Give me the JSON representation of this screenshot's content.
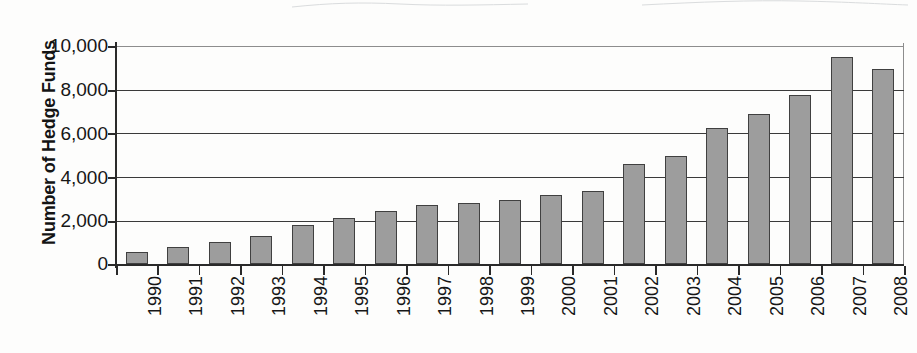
{
  "chart_data": {
    "type": "bar",
    "title": "",
    "subtitle": "",
    "xlabel": "",
    "ylabel": "Number of Hedge Funds",
    "categories": [
      "1990",
      "1991",
      "1992",
      "1993",
      "1994",
      "1995",
      "1996",
      "1997",
      "1998",
      "1999",
      "2000",
      "2001",
      "2002",
      "2003",
      "2004",
      "2005",
      "2006",
      "2007",
      "2008"
    ],
    "values": [
      560,
      780,
      1010,
      1300,
      1800,
      2100,
      2450,
      2700,
      2800,
      2950,
      3150,
      3350,
      4600,
      4950,
      6250,
      6900,
      7750,
      9500,
      8950
    ],
    "ylim": [
      0,
      10000
    ],
    "ytick_values": [
      0,
      2000,
      4000,
      6000,
      8000,
      10000
    ],
    "ytick_labels": [
      "0",
      "2,000",
      "4,000",
      "6,000",
      "8,000",
      "10,000"
    ],
    "grid": true,
    "legend": false,
    "legend_position": "none",
    "bar_fill_color": "#9d9d9d",
    "bar_edge_color": "#404040",
    "axis_color": "#2a2a2a",
    "gridline_color": "#3a3a3a",
    "background_color": "#fdfdfc",
    "xlabel_rotation": -90
  }
}
